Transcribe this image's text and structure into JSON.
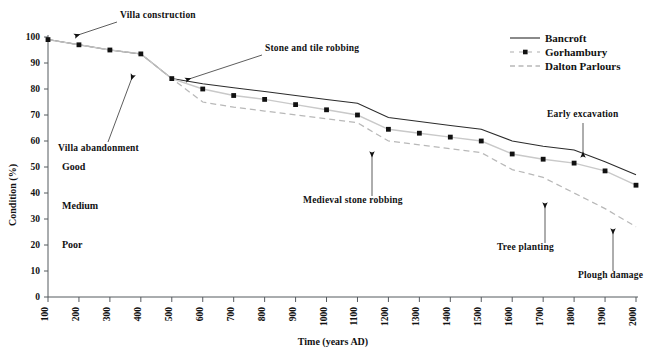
{
  "chart_data": {
    "type": "line",
    "title": "",
    "xlabel": "Time (years AD)",
    "ylabel": "Condition (%)",
    "xlim": [
      100,
      2000
    ],
    "ylim": [
      0,
      100
    ],
    "grid": false,
    "legend_position": "top-right",
    "x": [
      100,
      200,
      300,
      400,
      500,
      600,
      700,
      800,
      900,
      1000,
      1100,
      1200,
      1300,
      1400,
      1500,
      1600,
      1700,
      1800,
      1900,
      2000
    ],
    "xticklabels": [
      "100",
      "200",
      "300",
      "400",
      "500",
      "600",
      "700",
      "800",
      "900",
      "1000",
      "1100",
      "1200",
      "1300",
      "1400",
      "1500",
      "1600",
      "1700",
      "1800",
      "1900",
      "2000"
    ],
    "yticklabels": [
      "0",
      "10",
      "20",
      "30",
      "40",
      "50",
      "60",
      "70",
      "80",
      "90",
      "100"
    ],
    "yticks": [
      0,
      10,
      20,
      30,
      40,
      50,
      60,
      70,
      80,
      90,
      100
    ],
    "series": [
      {
        "name": "Bancroft",
        "style": "solid",
        "color": "#2b2b2b",
        "markers": false,
        "values": [
          99,
          97,
          95,
          93.5,
          84,
          82,
          80.5,
          79,
          77.5,
          76,
          74.5,
          69,
          67.5,
          66,
          64.5,
          60,
          58,
          56.5,
          52,
          47
        ]
      },
      {
        "name": "Gorhambury",
        "style": "solid-light-with-squares",
        "color": "#c9c9c9",
        "markers": true,
        "values": [
          99,
          97,
          95,
          93.5,
          84,
          80,
          77.5,
          76,
          74,
          72,
          70,
          64.5,
          63,
          61.5,
          60,
          55,
          53,
          51.5,
          48.5,
          43
        ]
      },
      {
        "name": "Dalton Parlours",
        "style": "dashed",
        "color": "#b8b8b8",
        "markers": false,
        "values": [
          99,
          97,
          95,
          93.5,
          84,
          75,
          73,
          71.5,
          70,
          68.5,
          67,
          60,
          58.5,
          57,
          55.5,
          49,
          46,
          40,
          34,
          27
        ]
      }
    ],
    "condition_bands": [
      {
        "label": "Good",
        "y": 50
      },
      {
        "label": "Medium",
        "y": 35
      },
      {
        "label": "Poor",
        "y": 20
      }
    ],
    "annotations": [
      {
        "label": "Villa construction",
        "text_x": 120,
        "text_y": 18,
        "arrow_to_x": 75,
        "arrow_to_y": 36,
        "arrow_from_x": 117,
        "arrow_from_y": 22,
        "head": "left"
      },
      {
        "label": "Villa abandonment",
        "text_x": 58,
        "text_y": 151,
        "arrow_to_x": 133,
        "arrow_to_y": 75,
        "arrow_from_x": 108,
        "arrow_from_y": 142,
        "head": "up"
      },
      {
        "label": "Stone and tile robbing",
        "text_x": 265,
        "text_y": 51,
        "arrow_to_x": 186,
        "arrow_to_y": 80,
        "arrow_from_x": 262,
        "arrow_from_y": 55,
        "head": "left"
      },
      {
        "label": "Medieval stone robbing",
        "text_x": 303,
        "text_y": 203,
        "arrow_to_x": 372,
        "arrow_to_y": 152,
        "arrow_from_x": 372,
        "arrow_from_y": 196,
        "head": "up"
      },
      {
        "label": "Early excavation",
        "text_x": 547,
        "text_y": 117,
        "arrow_to_x": 583,
        "arrow_to_y": 157,
        "arrow_from_x": 583,
        "arrow_from_y": 123,
        "head": "down"
      },
      {
        "label": "Tree planting",
        "text_x": 497,
        "text_y": 250,
        "arrow_to_x": 545,
        "arrow_to_y": 203,
        "arrow_from_x": 545,
        "arrow_from_y": 243,
        "head": "up"
      },
      {
        "label": "Plough damage",
        "text_x": 578,
        "text_y": 278,
        "arrow_to_x": 613,
        "arrow_to_y": 229,
        "arrow_from_x": 613,
        "arrow_from_y": 271,
        "head": "up"
      }
    ],
    "legend": [
      {
        "label": "Bancroft",
        "style": "solid",
        "color": "#2b2b2b"
      },
      {
        "label": "Gorhambury",
        "style": "light-with-square",
        "color": "#c9c9c9"
      },
      {
        "label": "Dalton Parlours",
        "style": "dashed",
        "color": "#b8b8b8"
      }
    ]
  },
  "geometry": {
    "plot_left": 48,
    "plot_right": 636,
    "plot_top": 37,
    "plot_bottom": 297,
    "legend_x": 510,
    "legend_y": 38,
    "legend_row_height": 14
  }
}
